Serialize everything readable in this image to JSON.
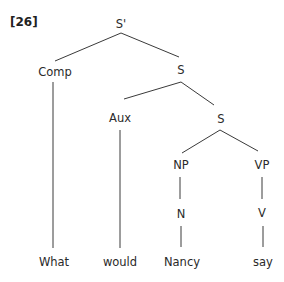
{
  "example_number": "[26]",
  "nodes": {
    "root": "S'",
    "comp": "Comp",
    "s1": "S",
    "aux": "Aux",
    "s2": "S",
    "np": "NP",
    "vp": "VP",
    "n": "N",
    "v": "V"
  },
  "words": {
    "w1": "What",
    "w2": "would",
    "w3": "Nancy",
    "w4": "say"
  },
  "tree_structure": "[S' [Comp What] [S [Aux would] [S [NP [N Nancy]] [VP [V say]]]]]"
}
